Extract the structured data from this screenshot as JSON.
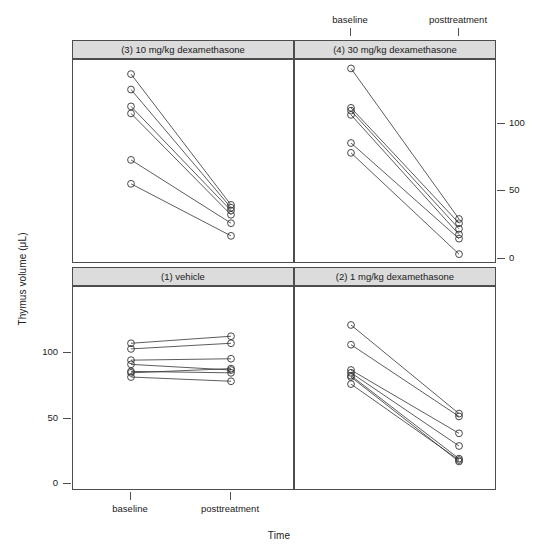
{
  "figure": {
    "ylabel": "Thymus volume (μL)",
    "xlabel": "Time",
    "caption": ""
  },
  "chart_data": {
    "type": "line",
    "title": "",
    "xlabel": "Time",
    "ylabel": "Thymus volume (μL)",
    "x": [
      "baseline",
      "posttreatment"
    ],
    "xlim": [
      0,
      1
    ],
    "ylim": [
      -5,
      140
    ],
    "yticks": [
      0,
      50,
      100
    ],
    "ytick_labels": [
      "0",
      "50",
      "100"
    ],
    "grid": false,
    "legend": "none",
    "panel_layout": {
      "rows": 2,
      "cols": 2
    },
    "panels": [
      {
        "id": "panel-3",
        "label": "(3) 10 mg/kg dexamethasone",
        "position": "top-left",
        "series": [
          {
            "name": "subject-1",
            "values": [
              130,
              37
            ]
          },
          {
            "name": "subject-2",
            "values": [
              119,
              35
            ]
          },
          {
            "name": "subject-3",
            "values": [
              107,
              33
            ]
          },
          {
            "name": "subject-4",
            "values": [
              102,
              30
            ]
          },
          {
            "name": "subject-5",
            "values": [
              69,
              24
            ]
          },
          {
            "name": "subject-6",
            "values": [
              52,
              15
            ]
          }
        ]
      },
      {
        "id": "panel-4",
        "label": "(4) 30 mg/kg dexamethasone",
        "position": "top-right",
        "series": [
          {
            "name": "subject-1",
            "values": [
              134,
              27
            ]
          },
          {
            "name": "subject-2",
            "values": [
              106,
              24
            ]
          },
          {
            "name": "subject-3",
            "values": [
              104,
              20
            ]
          },
          {
            "name": "subject-4",
            "values": [
              101,
              16
            ]
          },
          {
            "name": "subject-5",
            "values": [
              81,
              13
            ]
          },
          {
            "name": "subject-6",
            "values": [
              74,
              2
            ]
          }
        ]
      },
      {
        "id": "panel-1",
        "label": "(1) vehicle",
        "position": "bottom-left",
        "series": [
          {
            "name": "subject-1",
            "values": [
              100,
              105
            ]
          },
          {
            "name": "subject-2",
            "values": [
              96,
              100
            ]
          },
          {
            "name": "subject-3",
            "values": [
              88,
              89
            ]
          },
          {
            "name": "subject-4",
            "values": [
              85,
              81
            ]
          },
          {
            "name": "subject-5",
            "values": [
              80,
              79
            ]
          },
          {
            "name": "subject-6",
            "values": [
              79,
              82
            ]
          },
          {
            "name": "subject-7",
            "values": [
              76,
              73
            ]
          }
        ]
      },
      {
        "id": "panel-2",
        "label": "(2) 1 mg/kg dexamethasone",
        "position": "bottom-right",
        "series": [
          {
            "name": "subject-1",
            "values": [
              113,
              50
            ]
          },
          {
            "name": "subject-2",
            "values": [
              99,
              48
            ]
          },
          {
            "name": "subject-3",
            "values": [
              81,
              36
            ]
          },
          {
            "name": "subject-4",
            "values": [
              79,
              27
            ]
          },
          {
            "name": "subject-5",
            "values": [
              77,
              18
            ]
          },
          {
            "name": "subject-6",
            "values": [
              76,
              16
            ]
          },
          {
            "name": "subject-7",
            "values": [
              71,
              17
            ]
          }
        ]
      }
    ]
  },
  "axes": {
    "x_tick_labels": [
      "baseline",
      "posttreatment"
    ],
    "y_tick_labels": [
      "0",
      "50",
      "100"
    ]
  }
}
